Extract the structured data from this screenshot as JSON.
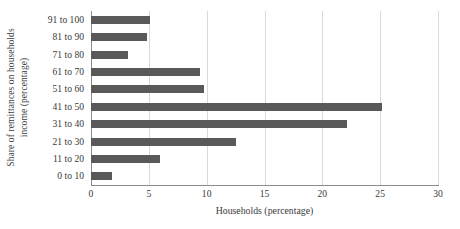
{
  "chart_data": {
    "type": "bar",
    "orientation": "horizontal",
    "title": "",
    "xlabel": "Households (percentage)",
    "ylabel": "Share of remittances on households income (percentage)",
    "ylabel_line1": "Share of remittances on households",
    "ylabel_line2": "income (percentage)",
    "categories": [
      "91 to 100",
      "81 to 90",
      "71 to 80",
      "61 to 70",
      "51 to 60",
      "41 to 50",
      "31 to 40",
      "21 to 30",
      "11 to 20",
      "0 to 10"
    ],
    "values": [
      5.1,
      4.8,
      3.2,
      9.4,
      9.8,
      25.2,
      22.1,
      12.5,
      6.0,
      1.8
    ],
    "xlim": [
      0,
      30
    ],
    "xticks": [
      0,
      5,
      10,
      15,
      20,
      25,
      30
    ],
    "xtick_labels": [
      "0",
      "5",
      "10",
      "15",
      "20",
      "25",
      "30"
    ],
    "grid": true,
    "grid_axis": "x",
    "legend": false,
    "bar_color": "#595959",
    "gridline_color": "#d9d9d9",
    "axis_color": "#8c8c8c",
    "background_color": "#ffffff"
  }
}
